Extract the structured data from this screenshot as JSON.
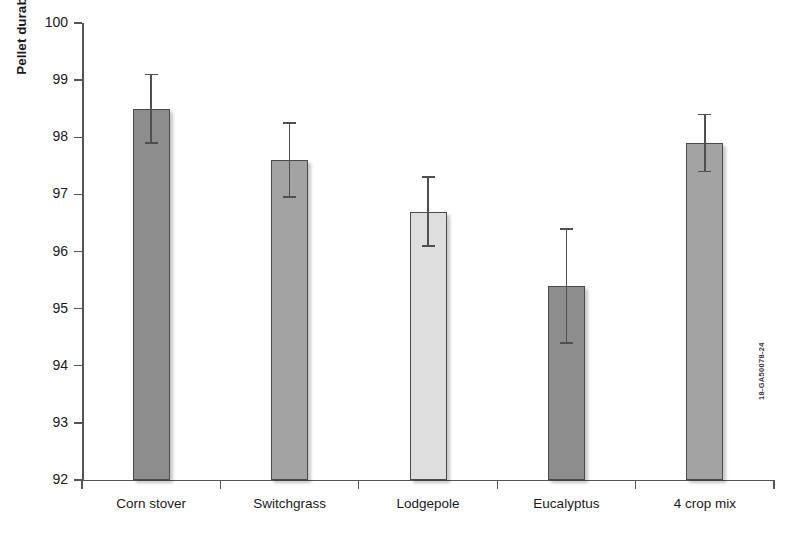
{
  "chart_data": {
    "type": "bar",
    "title": "",
    "xlabel": "",
    "ylabel": "Pellet durability (%)",
    "categories": [
      "Corn stover",
      "Switchgrass",
      "Lodgepole",
      "Eucalyptus",
      "4 crop mix"
    ],
    "values": [
      98.5,
      97.6,
      96.7,
      95.4,
      97.9
    ],
    "errors_upper": [
      0.6,
      0.65,
      0.6,
      1.0,
      0.5
    ],
    "errors_lower": [
      0.6,
      0.65,
      0.6,
      1.0,
      0.5
    ],
    "bar_colors": [
      "#8d8d8d",
      "#a3a3a3",
      "#dedede",
      "#8d8d8d",
      "#a3a3a3"
    ],
    "bar_edge_color": "#4a4a4a",
    "error_bar_color": "#4f4f4f",
    "ylim": [
      92,
      100
    ],
    "ytick_values": [
      92,
      93,
      94,
      95,
      96,
      97,
      98,
      99,
      100
    ],
    "ytick_labels": [
      "92",
      "93",
      "94",
      "95",
      "96",
      "97",
      "98",
      "99",
      "100"
    ],
    "grid": false,
    "legend": false,
    "legend_position": "none"
  },
  "figure": {
    "watermark": "18-GA50078-24",
    "caption_fragment": ""
  }
}
